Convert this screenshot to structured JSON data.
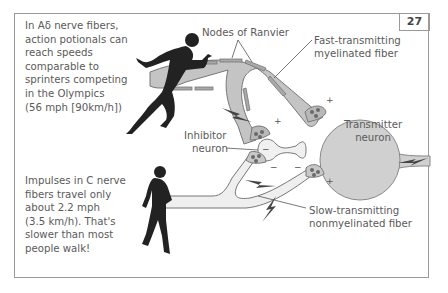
{
  "page_number": "27",
  "notes": {
    "fast_fiber": [
      "In Aδ nerve fibers,",
      "action potionals can",
      "reach speeds",
      "comparable to",
      "sprinters competing",
      "in the Olympics",
      "(56 mph [90km/h])"
    ],
    "slow_fiber": [
      "Impulses in C nerve",
      "fibers travel only",
      "about 2.2 mph",
      "(3.5 km/h). That's",
      "slower than most",
      "people walk!"
    ]
  },
  "labels": {
    "nodes_of_ranvier": "Nodes of Ranvier",
    "fast_fiber": [
      "Fast-transmitting",
      "myelinated fiber"
    ],
    "inhibitor_neuron": [
      "Inhibitor",
      "neuron"
    ],
    "transmitter_neuron": [
      "Transmitter",
      "neuron"
    ],
    "slow_fiber": [
      "Slow-transmitting",
      "nonmyelinated fiber"
    ]
  },
  "signs": {
    "plus": "+",
    "minus": "−"
  },
  "colors": {
    "border": "#9a9a9a",
    "text": "#5a5a5a",
    "myelinated_fiber": "#c4c4c4",
    "myelin_sheath": "#a8a8a8",
    "nonmyelinated_fiber": "#efefef",
    "transmitter_neuron": "#d0d0d0",
    "silhouette": "#222222",
    "vesicle": "#6a6a6a"
  },
  "figures": {
    "runner": "sprinter-silhouette",
    "walker": "walking-person-silhouette"
  }
}
